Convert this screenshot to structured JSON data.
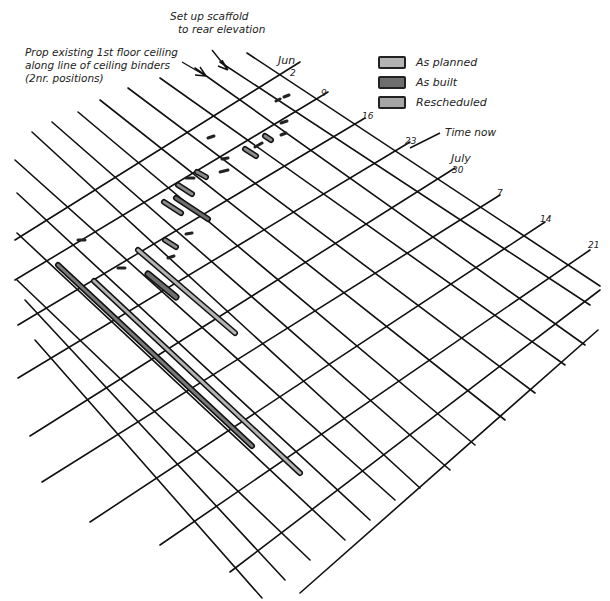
{
  "annotations": {
    "scaffold": [
      "Set up scaffold",
      "to rear elevation"
    ],
    "prop": [
      "Prop existing 1st floor ceiling",
      "along line of ceiling binders",
      "(2nr. positions)"
    ],
    "time_now": "Time now"
  },
  "legend": [
    {
      "label": "As planned",
      "color": "#b3b3b3"
    },
    {
      "label": "As built",
      "color": "#6e6e6e"
    },
    {
      "label": "Rescheduled",
      "color": "#a6a6a6"
    }
  ],
  "date_ticks": [
    {
      "label": "Jun",
      "x": 278,
      "y": 54
    },
    {
      "label": "2",
      "x": 290,
      "y": 68
    },
    {
      "label": "9",
      "x": 321,
      "y": 88
    },
    {
      "label": "16",
      "x": 362,
      "y": 111
    },
    {
      "label": "23",
      "x": 405,
      "y": 136
    },
    {
      "label": "July",
      "x": 451,
      "y": 152
    },
    {
      "label": "30",
      "x": 452,
      "y": 165
    },
    {
      "label": "7",
      "x": 497,
      "y": 188
    },
    {
      "label": "14",
      "x": 540,
      "y": 214
    },
    {
      "label": "21",
      "x": 588,
      "y": 240
    }
  ],
  "chart_data": {
    "type": "gantt",
    "title": "",
    "view": "isometric hand-drawn bar chart",
    "time_axis_labels": [
      "Jun 2",
      "9",
      "16",
      "23",
      "July 30",
      "7",
      "14",
      "21"
    ],
    "legend": [
      "As planned",
      "As built",
      "Rescheduled"
    ],
    "annotations": [
      "Set up scaffold to rear elevation",
      "Prop existing 1st floor ceiling along line of ceiling binders (2nr. positions)",
      "Time now"
    ]
  }
}
